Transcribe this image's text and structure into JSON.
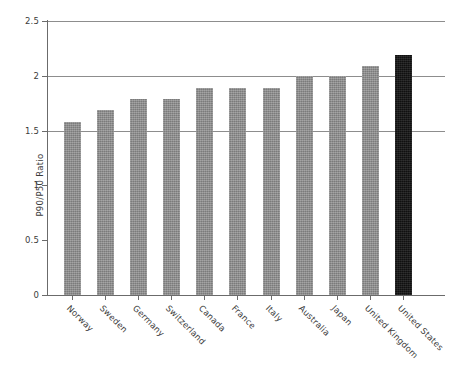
{
  "chart_data": {
    "type": "bar",
    "title": "",
    "subtitle": "",
    "xlabel": "",
    "ylabel": "P90/P50 Ratio",
    "categories": [
      "Norway",
      "Sweden",
      "Germany",
      "Switzerland",
      "Canada",
      "France",
      "Italy",
      "Australia",
      "Japan",
      "United Kingdom",
      "United States"
    ],
    "values": [
      1.58,
      1.69,
      1.79,
      1.79,
      1.89,
      1.89,
      1.89,
      2.0,
      2.0,
      2.09,
      2.19
    ],
    "series": [
      {
        "name": "P90/P50 Ratio",
        "values": [
          1.58,
          1.69,
          1.79,
          1.79,
          1.89,
          1.89,
          1.89,
          2.0,
          2.0,
          2.09,
          2.19
        ]
      }
    ],
    "ylim": [
      0,
      2.5
    ],
    "yticks": [
      0,
      0.5,
      1,
      1.5,
      2,
      2.5
    ],
    "ytick_labels": [
      "0",
      "0.5",
      "1",
      "1.5",
      "2",
      "2.5"
    ],
    "gridlines": [
      1.5,
      2,
      2.5
    ],
    "grid": true,
    "legend": false,
    "legend_position": "none",
    "bar_color": "#8c8c8c",
    "highlight_color": "#131313",
    "highlight_category": "United States",
    "axis_color": "#6b6b6b",
    "grid_color": "#8d8d8d",
    "background": "#ffffff",
    "xtick_rotation": 45,
    "annotations": []
  }
}
